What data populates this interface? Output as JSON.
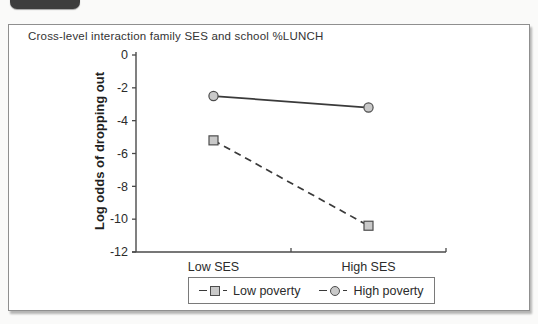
{
  "figure": {
    "tab_note": "dark rounded figure tab, text cropped out of frame"
  },
  "colors": {
    "page_background": "#fafaf9",
    "panel_background": "#ffffff",
    "panel_border": "#8f8f8f",
    "badge": "#3d3d3d",
    "axis": "#4a4a4a",
    "line": "#3a3a3a",
    "marker_fill": "#c9c9c9",
    "marker_stroke": "#4d4d4d",
    "text": "#2b2b2b"
  },
  "chart_data": {
    "type": "line",
    "title": "Cross-level interaction family SES and school %LUNCH",
    "categories": [
      "Low SES",
      "High SES"
    ],
    "series": [
      {
        "name": "Low poverty",
        "values": [
          -5.2,
          -10.4
        ],
        "line_style": "dashed",
        "marker": "square"
      },
      {
        "name": "High poverty",
        "values": [
          -2.5,
          -3.2
        ],
        "line_style": "solid",
        "marker": "circle"
      }
    ],
    "xlabel": "",
    "ylabel": "Log odds of dropping out",
    "ylim": [
      -12,
      0
    ],
    "yticks": [
      0,
      -2,
      -4,
      -6,
      -8,
      -10,
      -12
    ],
    "grid": false,
    "legend_position": "bottom"
  }
}
